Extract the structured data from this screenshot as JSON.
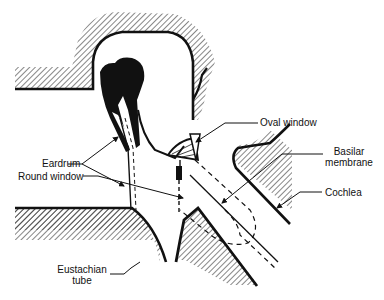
{
  "diagram": {
    "type": "anatomical cross-section",
    "colors": {
      "ink": "#111111",
      "background": "#ffffff"
    },
    "labels": {
      "eardrum": "Eardrum",
      "oval_window": "Oval window",
      "basilar_membrane_line1": "Basilar",
      "basilar_membrane_line2": "membrane",
      "round_window": "Round window",
      "cochlea": "Cochlea",
      "eustachian_tube_line1": "Eustachian",
      "eustachian_tube_line2": "tube"
    }
  }
}
